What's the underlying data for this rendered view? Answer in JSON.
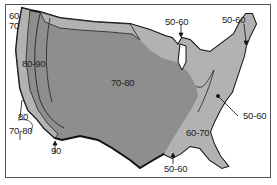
{
  "map": {
    "title": "",
    "region": "Contiguous United States",
    "colors": {
      "dark_zone": "#8e8e8e",
      "light_zone": "#b2b2b2",
      "outline": "#111111",
      "background": "#ffffff"
    },
    "zones": [
      {
        "id": "west-coast-north",
        "label": "60-70",
        "display": "60\n70"
      },
      {
        "id": "california-interior",
        "label": "80-90"
      },
      {
        "id": "central",
        "label": "70-80"
      },
      {
        "id": "southeast",
        "label": "60-70"
      }
    ],
    "annotations": [
      {
        "id": "nw-coast-top",
        "label": "60"
      },
      {
        "id": "nw-coast-bottom",
        "label": "70"
      },
      {
        "id": "ca-coast-80",
        "label": "80"
      },
      {
        "id": "ca-coast-70-80",
        "label": "70-80"
      },
      {
        "id": "baja-90",
        "label": "90"
      },
      {
        "id": "great-lakes",
        "label": "50-60"
      },
      {
        "id": "new-england",
        "label": "50-60"
      },
      {
        "id": "appalachia",
        "label": "50-60"
      },
      {
        "id": "gulf-coast",
        "label": "50-60"
      }
    ]
  }
}
